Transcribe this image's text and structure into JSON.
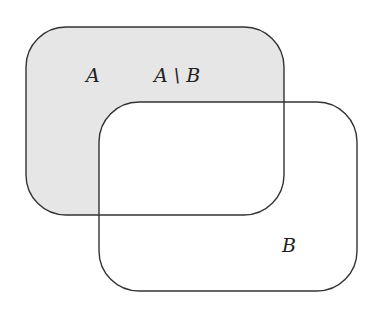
{
  "diagram": {
    "type": "venn-rounded-rectangles",
    "sets": [
      {
        "name": "A",
        "label": "A",
        "shaded": true
      },
      {
        "name": "B",
        "label": "B",
        "shaded": false
      }
    ],
    "region_label": "A \\ B",
    "colors": {
      "fill": "#e6e6e6",
      "stroke": "#333333"
    }
  }
}
